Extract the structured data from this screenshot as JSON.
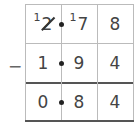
{
  "operation": "subtraction",
  "operator": "−",
  "rows": [
    {
      "role": "minuend",
      "cells": [
        {
          "carry": "1",
          "digit": "2",
          "struck": true
        },
        {
          "carry": "1",
          "digit": "7"
        },
        {
          "digit": "8"
        }
      ]
    },
    {
      "role": "subtrahend",
      "cells": [
        {
          "digit": "1"
        },
        {
          "digit": "9"
        },
        {
          "digit": "4"
        }
      ]
    },
    {
      "role": "difference",
      "cells": [
        {
          "digit": "0"
        },
        {
          "digit": "8"
        },
        {
          "digit": "4"
        }
      ]
    }
  ],
  "decimal_point_after_column": 1
}
